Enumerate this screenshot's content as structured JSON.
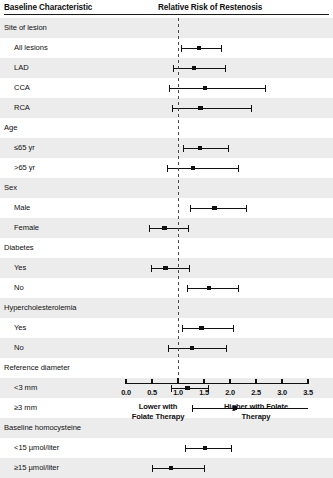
{
  "header": {
    "left_title": "Baseline Characteristic",
    "right_title": "Relative Risk of Restenosis"
  },
  "axis": {
    "ticks": [
      "0.0",
      "0.5",
      "1.0",
      "1.5",
      "2.0",
      "2.5",
      "3.0",
      "3.5"
    ],
    "caption_left": "Lower with\nFolate Therapy",
    "caption_left_line1": "Lower with",
    "caption_left_line2": "Folate Therapy",
    "caption_right_line1": "Higher with Folate",
    "caption_right_line2": "Therapy"
  },
  "rows": [
    {
      "label": "Site of lesion",
      "type": "group"
    },
    {
      "label": "All lesions",
      "type": "item"
    },
    {
      "label": "LAD",
      "type": "item"
    },
    {
      "label": "CCA",
      "type": "item"
    },
    {
      "label": "RCA",
      "type": "item"
    },
    {
      "label": "Age",
      "type": "group"
    },
    {
      "label": "≤65 yr",
      "type": "item"
    },
    {
      "label": ">65 yr",
      "type": "item"
    },
    {
      "label": "Sex",
      "type": "group"
    },
    {
      "label": "Male",
      "type": "item"
    },
    {
      "label": "Female",
      "type": "item"
    },
    {
      "label": "Diabetes",
      "type": "group"
    },
    {
      "label": "Yes",
      "type": "item"
    },
    {
      "label": "No",
      "type": "item"
    },
    {
      "label": "Hypercholesterolemia",
      "type": "group"
    },
    {
      "label": "Yes",
      "type": "item"
    },
    {
      "label": "No",
      "type": "item"
    },
    {
      "label": "Reference diameter",
      "type": "group"
    },
    {
      "label": "<3 mm",
      "type": "item"
    },
    {
      "label": "≥3 mm",
      "type": "item"
    },
    {
      "label": "Baseline homocysteine",
      "type": "group"
    },
    {
      "label": "<15 µmol/liter",
      "type": "item"
    },
    {
      "label": "≥15 µmol/liter",
      "type": "item"
    }
  ],
  "chart_data": {
    "type": "forest",
    "title": "Relative Risk of Restenosis",
    "xlabel": "Relative Risk of Restenosis",
    "ylabel": "Baseline Characteristic",
    "xlim": [
      0.0,
      3.5
    ],
    "xticks": [
      0.0,
      0.5,
      1.0,
      1.5,
      2.0,
      2.5,
      3.0,
      3.5
    ],
    "reference_line": 1.0,
    "grid": false,
    "legend": "none",
    "annotations": [
      "Lower with Folate Therapy",
      "Higher with Folate Therapy"
    ],
    "groups": [
      {
        "name": "Site of lesion",
        "entries": [
          {
            "label": "All lesions",
            "rr": 1.4,
            "ci_low": 1.05,
            "ci_high": 1.82,
            "clipped_high": false
          },
          {
            "label": "LAD",
            "rr": 1.31,
            "ci_low": 0.91,
            "ci_high": 1.91,
            "clipped_high": false
          },
          {
            "label": "CCA",
            "rr": 1.52,
            "ci_low": 0.83,
            "ci_high": 2.67,
            "clipped_high": false
          },
          {
            "label": "RCA",
            "rr": 1.43,
            "ci_low": 0.88,
            "ci_high": 2.4,
            "clipped_high": false
          }
        ]
      },
      {
        "name": "Age",
        "entries": [
          {
            "label": "≤65 yr",
            "rr": 1.42,
            "ci_low": 1.1,
            "ci_high": 1.97,
            "clipped_high": false
          },
          {
            "label": ">65 yr",
            "rr": 1.29,
            "ci_low": 0.78,
            "ci_high": 2.15,
            "clipped_high": false
          }
        ]
      },
      {
        "name": "Sex",
        "entries": [
          {
            "label": "Male",
            "rr": 1.7,
            "ci_low": 1.24,
            "ci_high": 2.31,
            "clipped_high": false
          },
          {
            "label": "Female",
            "rr": 0.74,
            "ci_low": 0.45,
            "ci_high": 1.2,
            "clipped_high": false
          }
        ]
      },
      {
        "name": "Diabetes",
        "entries": [
          {
            "label": "Yes",
            "rr": 0.76,
            "ci_low": 0.49,
            "ci_high": 1.21,
            "clipped_high": false
          },
          {
            "label": "No",
            "rr": 1.6,
            "ci_low": 1.17,
            "ci_high": 2.16,
            "clipped_high": false
          }
        ]
      },
      {
        "name": "Hypercholesterolemia",
        "entries": [
          {
            "label": "Yes",
            "rr": 1.45,
            "ci_low": 1.08,
            "ci_high": 2.05,
            "clipped_high": false
          },
          {
            "label": "No",
            "rr": 1.27,
            "ci_low": 0.81,
            "ci_high": 1.92,
            "clipped_high": false
          }
        ]
      },
      {
        "name": "Reference diameter",
        "entries": [
          {
            "label": "<3 mm",
            "rr": 1.18,
            "ci_low": 0.87,
            "ci_high": 1.58,
            "clipped_high": false
          },
          {
            "label": "≥3 mm",
            "rr": 2.1,
            "ci_low": 1.26,
            "ci_high": 3.5,
            "clipped_high": true
          }
        ]
      },
      {
        "name": "Baseline homocysteine",
        "entries": [
          {
            "label": "<15 µmol/liter",
            "rr": 1.52,
            "ci_low": 1.14,
            "ci_high": 2.02,
            "clipped_high": false
          },
          {
            "label": "≥15 µmol/liter",
            "rr": 0.87,
            "ci_low": 0.5,
            "ci_high": 1.5,
            "clipped_high": false
          }
        ]
      }
    ]
  }
}
